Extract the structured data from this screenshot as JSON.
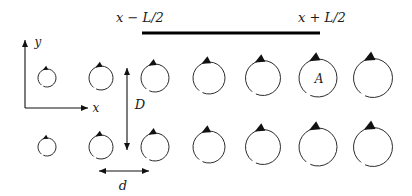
{
  "figure": {
    "background_color": "#ffffff",
    "ink_color": "#111111",
    "width": 412,
    "height": 196
  },
  "labels": {
    "slab_left": "x − L/2",
    "slab_right": "x + L/2",
    "axis_x": "x",
    "axis_y": "y",
    "row_spacing": "D",
    "column_spacing": "d",
    "area_label": "A"
  },
  "chart_data": {
    "type": "scatter",
    "xlabel": "x",
    "ylabel": "y",
    "grid": false,
    "legend": null,
    "xlim": [
      0,
      412
    ],
    "ylim": [
      196,
      0
    ],
    "axes_origin": {
      "x": 25,
      "y": 108
    },
    "axes": [
      {
        "name": "y-axis",
        "x1": 25,
        "y1": 108,
        "x2": 25,
        "y2": 40,
        "arrow": "up",
        "label": "y",
        "label_x": 38,
        "label_y": 46
      },
      {
        "name": "x-axis",
        "x1": 25,
        "y1": 108,
        "x2": 88,
        "y2": 108,
        "arrow": "right",
        "label": "x",
        "label_x": 96,
        "label_y": 112
      }
    ],
    "slab": {
      "label_left": "x − L/2",
      "label_right": "x + L/2",
      "x1": 142,
      "x2": 320,
      "y": 33,
      "thickness": 3.2,
      "label_left_x": 140,
      "label_left_y": 22,
      "label_right_x": 322,
      "label_right_y": 22
    },
    "dimensions": [
      {
        "name": "D",
        "orientation": "vertical",
        "label": "D",
        "x": 127,
        "y1": 68,
        "y2": 150,
        "label_x": 140,
        "label_y": 109
      },
      {
        "name": "d",
        "orientation": "horizontal",
        "label": "d",
        "y": 171,
        "x1": 99,
        "x2": 149,
        "label_x": 123,
        "label_y": 190
      }
    ],
    "columns_x": [
      47,
      101,
      155,
      209,
      263,
      318,
      373
    ],
    "radii": [
      9,
      12,
      14,
      16,
      17.5,
      19,
      19.5
    ],
    "rows_y": [
      78,
      147
    ],
    "rotation_sense": "counterclockwise",
    "series": [
      {
        "name": "top-row-vortices",
        "row": "top",
        "y": 78,
        "points": [
          {
            "index": 0,
            "x": 47,
            "y": 78,
            "r": 9,
            "label": null
          },
          {
            "index": 1,
            "x": 101,
            "y": 78,
            "r": 12,
            "label": null
          },
          {
            "index": 2,
            "x": 155,
            "y": 78,
            "r": 14,
            "label": null
          },
          {
            "index": 3,
            "x": 209,
            "y": 78,
            "r": 16,
            "label": null
          },
          {
            "index": 4,
            "x": 263,
            "y": 78,
            "r": 17.5,
            "label": null
          },
          {
            "index": 5,
            "x": 318,
            "y": 78,
            "r": 19,
            "label": "A"
          },
          {
            "index": 6,
            "x": 373,
            "y": 78,
            "r": 19.5,
            "label": null
          }
        ]
      },
      {
        "name": "bottom-row-vortices",
        "row": "bottom",
        "y": 147,
        "points": [
          {
            "index": 0,
            "x": 47,
            "y": 147,
            "r": 9,
            "label": null
          },
          {
            "index": 1,
            "x": 101,
            "y": 147,
            "r": 12,
            "label": null
          },
          {
            "index": 2,
            "x": 155,
            "y": 147,
            "r": 14,
            "label": null
          },
          {
            "index": 3,
            "x": 209,
            "y": 147,
            "r": 16,
            "label": null
          },
          {
            "index": 4,
            "x": 263,
            "y": 147,
            "r": 17.5,
            "label": null
          },
          {
            "index": 5,
            "x": 318,
            "y": 147,
            "r": 19,
            "label": null
          },
          {
            "index": 6,
            "x": 373,
            "y": 147,
            "r": 19.5,
            "label": null
          }
        ]
      }
    ]
  }
}
